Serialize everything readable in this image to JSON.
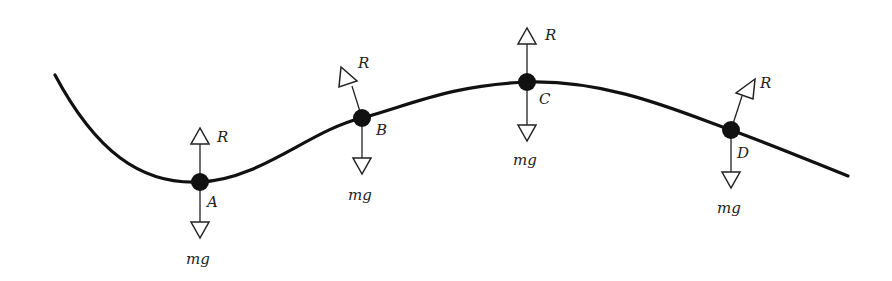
{
  "diagram": {
    "points": [
      {
        "id": "A",
        "label": "A",
        "reaction_label": "R",
        "weight_label": "mg"
      },
      {
        "id": "B",
        "label": "B",
        "reaction_label": "R",
        "weight_label": "mg"
      },
      {
        "id": "C",
        "label": "C",
        "reaction_label": "R",
        "weight_label": "mg"
      },
      {
        "id": "D",
        "label": "D",
        "reaction_label": "R",
        "weight_label": "mg"
      }
    ]
  }
}
